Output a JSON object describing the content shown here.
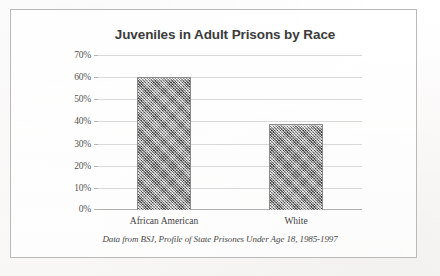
{
  "figure": {
    "title": "Juveniles in Adult Prisons by Race",
    "caption": "Data from BSJ, Profile of State Prisones Under Age 18, 1985-1997",
    "frame_color": "#b9b9b9",
    "background_color": "#fdfdfc"
  },
  "chart_data": {
    "type": "bar",
    "title": "Juveniles in Adult Prisons by Race",
    "subtitle": "",
    "categories": [
      "African American",
      "White"
    ],
    "values": [
      60,
      39
    ],
    "value_suffix": "%",
    "series": [
      {
        "name": "Share of juveniles in adult prisons",
        "values": [
          60,
          39
        ]
      }
    ],
    "xlabel": "",
    "ylabel": "",
    "ylim": [
      0,
      70
    ],
    "ytick_values": [
      0,
      10,
      20,
      30,
      40,
      50,
      60,
      70
    ],
    "ytick_labels": [
      "0%",
      "10%",
      "20%",
      "30%",
      "40%",
      "50%",
      "60%",
      "70%"
    ],
    "grid": true,
    "grid_axis": "y",
    "legend": false,
    "legend_position": "none",
    "bar_color": "#9d9d9d",
    "bar_texture": "dithered-gray-halftone",
    "gridline_color": "#d9d9d9",
    "annotations": [
      "Data from BSJ, Profile of State Prisones Under Age 18, 1985-1997"
    ]
  }
}
